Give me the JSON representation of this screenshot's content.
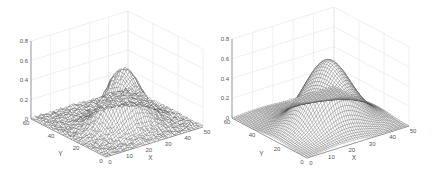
{
  "chart_data": [
    {
      "type": "surface",
      "title": "",
      "style": "mesh",
      "xlabel": "X",
      "ylabel": "Y",
      "zlabel": "",
      "xlim": [
        0,
        50
      ],
      "ylim": [
        0,
        60
      ],
      "zlim": [
        0,
        0.8
      ],
      "xticks": [
        "0",
        "10",
        "20",
        "30",
        "40",
        "50"
      ],
      "yticks": [
        "0",
        "20",
        "40",
        "60"
      ],
      "zticks": [
        "0",
        "0.2",
        "0.4",
        "0.6",
        "0.8"
      ],
      "grid": true,
      "surface": {
        "shape": "noisy gaussian bump",
        "peak_z": 0.58,
        "center": [
          25,
          25
        ],
        "sigma": 8,
        "noise": 0.03,
        "grid_n": 50
      },
      "colors": {
        "mesh": "#333333",
        "face": "#ffffff",
        "grid": "#e4e4e4",
        "axis": "#777777"
      }
    },
    {
      "type": "surface",
      "title": "",
      "style": "mesh",
      "xlabel": "X",
      "ylabel": "Y",
      "zlabel": "",
      "xlim": [
        0,
        50
      ],
      "ylim": [
        0,
        60
      ],
      "zlim": [
        0,
        0.8
      ],
      "xticks": [
        "0",
        "10",
        "20",
        "30",
        "40",
        "50"
      ],
      "yticks": [
        "0",
        "20",
        "40",
        "60"
      ],
      "zticks": [
        "0",
        "0.2",
        "0.4",
        "0.6",
        "0.8"
      ],
      "grid": true,
      "surface": {
        "shape": "smooth gaussian bump",
        "peak_z": 0.66,
        "center": [
          25,
          25
        ],
        "sigma": 10,
        "noise": 0,
        "grid_n": 50
      },
      "colors": {
        "mesh": "#333333",
        "face": "#ffffff",
        "grid": "#e4e4e4",
        "axis": "#777777"
      }
    }
  ],
  "layout": {
    "panels": [
      {
        "origin": [
          106,
          157
        ],
        "xEnd": [
          203,
          127
        ],
        "yEnd": [
          31,
          119
        ],
        "zTop": 78
      },
      {
        "origin": [
          307,
          158
        ],
        "xEnd": [
          409,
          126
        ],
        "yEnd": [
          232,
          118
        ],
        "zTop": 79
      }
    ]
  }
}
